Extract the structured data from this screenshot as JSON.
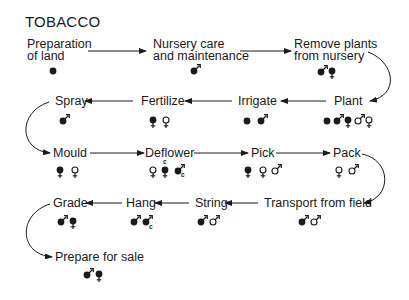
{
  "title": "TOBACCO",
  "legend_semantics": {
    "dot": "filled circle",
    "male_filled": "filled male symbol",
    "female_filled": "filled female symbol",
    "male_open": "open male symbol",
    "female_open": "open female symbol",
    "c_marker": "c"
  },
  "steps": [
    {
      "id": "prep",
      "label_line1": "Preparation",
      "label_line2": "of land",
      "symbols": [
        "dot"
      ]
    },
    {
      "id": "nursery",
      "label_line1": "Nursery care",
      "label_line2": "and maintenance",
      "symbols": [
        "male_filled"
      ]
    },
    {
      "id": "remove",
      "label_line1": "Remove plants",
      "label_line2": "from nursery",
      "symbols": [
        "male_filled",
        "female_filled"
      ]
    },
    {
      "id": "plant",
      "label_line1": "Plant",
      "symbols": [
        "dot",
        "male_filled",
        "female_filled",
        "male_open",
        "female_open"
      ]
    },
    {
      "id": "irrigate",
      "label_line1": "Irrigate",
      "symbols": [
        "dot",
        "male_filled"
      ]
    },
    {
      "id": "fertilize",
      "label_line1": "Fertilize",
      "symbols": [
        "female_filled",
        "female_open"
      ]
    },
    {
      "id": "spray",
      "label_line1": "Spray",
      "symbols": [
        "male_filled"
      ]
    },
    {
      "id": "mould",
      "label_line1": "Mould",
      "symbols": [
        "female_filled",
        "female_open"
      ]
    },
    {
      "id": "deflower",
      "label_line1": "Deflower",
      "symbols": [
        "female_open",
        "female_filled_c",
        "male_filled_c"
      ]
    },
    {
      "id": "pick",
      "label_line1": "Pick",
      "symbols": [
        "female_filled",
        "female_open",
        "male_open"
      ]
    },
    {
      "id": "pack",
      "label_line1": "Pack",
      "symbols": [
        "female_open",
        "male_open"
      ]
    },
    {
      "id": "transport",
      "label_line1": "Transport from field",
      "symbols": [
        "male_filled",
        "male_open"
      ]
    },
    {
      "id": "string",
      "label_line1": "String",
      "symbols": [
        "male_filled",
        "male_open"
      ]
    },
    {
      "id": "hang",
      "label_line1": "Hang",
      "symbols": [
        "male_filled",
        "male_filled_c"
      ]
    },
    {
      "id": "grade",
      "label_line1": "Grade",
      "symbols": [
        "male_filled",
        "female_filled"
      ]
    },
    {
      "id": "prepare",
      "label_line1": "Prepare for sale",
      "symbols": [
        "male_filled",
        "female_filled"
      ]
    }
  ],
  "c_label": "c",
  "colors": {
    "ink": "#1a1a1a",
    "background": "#ffffff"
  }
}
